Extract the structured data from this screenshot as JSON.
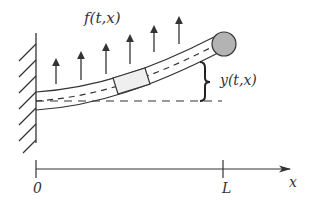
{
  "diagram": {
    "labels": {
      "force": "f(t,x)",
      "deflection": "y(t,x)",
      "origin": "0",
      "length": "L",
      "axis": "x"
    },
    "colors": {
      "stroke": "#333333",
      "tip_mass_fill": "#b3b3b3",
      "element_fill": "#efefef",
      "background": "#ffffff"
    },
    "force_arrows": [
      {
        "x": 56,
        "tip_y": 60,
        "base_y": 84
      },
      {
        "x": 81,
        "tip_y": 53,
        "base_y": 80
      },
      {
        "x": 106,
        "tip_y": 45,
        "base_y": 74
      },
      {
        "x": 130,
        "tip_y": 36,
        "base_y": 64
      },
      {
        "x": 154,
        "tip_y": 27,
        "base_y": 52
      },
      {
        "x": 179,
        "tip_y": 18,
        "base_y": 44
      }
    ],
    "wall": {
      "x": 36,
      "top": 33,
      "bottom": 143,
      "hatch_count": 7
    },
    "tip_mass": {
      "cx": 224,
      "cy": 44,
      "r": 12
    },
    "axis": {
      "y": 169,
      "x_start": 36,
      "x_end": 290,
      "ticks": [
        36,
        223
      ]
    }
  }
}
